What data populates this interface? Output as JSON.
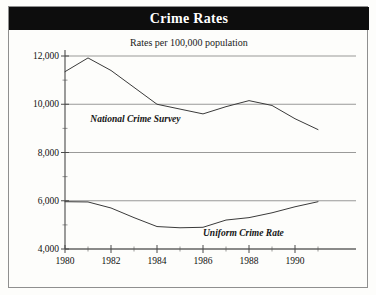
{
  "figure": {
    "title": "Crime Rates",
    "subtitle": "Rates per 100,000 population"
  },
  "chart_data": {
    "type": "line",
    "title": "Crime Rates",
    "subtitle": "Rates per 100,000 population",
    "xlabel": "",
    "ylabel": "",
    "xlim": [
      1980,
      1991
    ],
    "ylim": [
      4000,
      12000
    ],
    "grid": true,
    "legend_position": "inline-annotation",
    "x_ticks_major": [
      1980,
      1982,
      1984,
      1986,
      1988,
      1990
    ],
    "x_ticks_major_labels": [
      "1980",
      "1982",
      "1984",
      "1986",
      "1988",
      "1990"
    ],
    "x_ticks_minor": [
      1981,
      1983,
      1985,
      1987,
      1989,
      1991
    ],
    "y_ticks_major": [
      4000,
      6000,
      8000,
      10000,
      12000
    ],
    "y_ticks_major_labels": [
      "4,000",
      "6,000",
      "8,000",
      "10,000",
      "12,000"
    ],
    "y_ticks_minor": [
      5000,
      7000,
      9000,
      11000
    ],
    "x": [
      1980,
      1981,
      1982,
      1983,
      1984,
      1985,
      1986,
      1987,
      1988,
      1989,
      1990,
      1991
    ],
    "series": [
      {
        "name": "National Crime Survey",
        "label_x": 1981.1,
        "label_y": 9350,
        "values": [
          11350,
          11920,
          11400,
          10700,
          10000,
          9800,
          9600,
          9900,
          10150,
          9950,
          9400,
          8950
        ]
      },
      {
        "name": "Uniform Crime Rate",
        "label_x": 1986.0,
        "label_y": 4640,
        "values": [
          5960,
          5950,
          5700,
          5300,
          4930,
          4880,
          4900,
          5200,
          5300,
          5500,
          5750,
          5960
        ]
      }
    ]
  }
}
